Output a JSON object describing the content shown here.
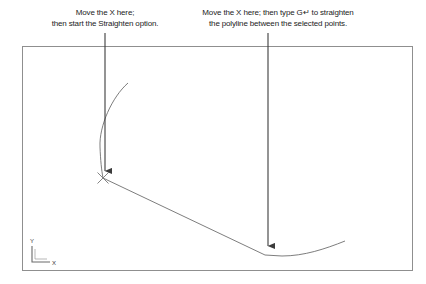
{
  "figure": {
    "kind": "cad-polyline-edit-illustration",
    "background_color": "#ffffff",
    "text_color": "#232323",
    "line_color": "#6e6e6e",
    "arrow_color": "#3c3c3c",
    "border_color": "#8f8f8f"
  },
  "callouts": {
    "left": {
      "name": "move-x-start-straighten",
      "line1": "Move the X here;",
      "line2": "then start the Straighten option.",
      "arrow": {
        "x": 105,
        "y_start": 33,
        "y_end": 178
      }
    },
    "right": {
      "name": "move-x-type-g-enter",
      "line1": "Move the X here; then type G↵ to straighten",
      "line2": "the polyline between the selected points.",
      "arrow": {
        "x": 268,
        "y_start": 33,
        "y_end": 253
      }
    }
  },
  "drawing_area": {
    "label": "drawing-viewport",
    "x": 22,
    "y": 46,
    "width": 390,
    "height": 224
  },
  "ucs_icon": {
    "label": "ucs-icon",
    "x_axis_label": "X",
    "y_axis_label": "Y",
    "origin_x": 32,
    "origin_y": 262
  },
  "polyline": {
    "label": "polyline-being-edited",
    "segments": [
      {
        "name": "upper-curved-segment",
        "type": "curve",
        "path": "M 128 83 C 112 97, 99 126, 100 147 C 100.5 160, 101.5 170, 103 178"
      },
      {
        "name": "straight-diagonal-segment",
        "type": "line",
        "path": "M 103 178 L 265 255"
      },
      {
        "name": "lower-curved-segment",
        "type": "curve",
        "path": "M 265 255 L 282 256 C 304 256, 325 249, 345 241"
      }
    ]
  },
  "markers": {
    "x_marker": {
      "name": "x-vertex-marker",
      "glyph": "X",
      "x": 103,
      "y": 178
    }
  }
}
